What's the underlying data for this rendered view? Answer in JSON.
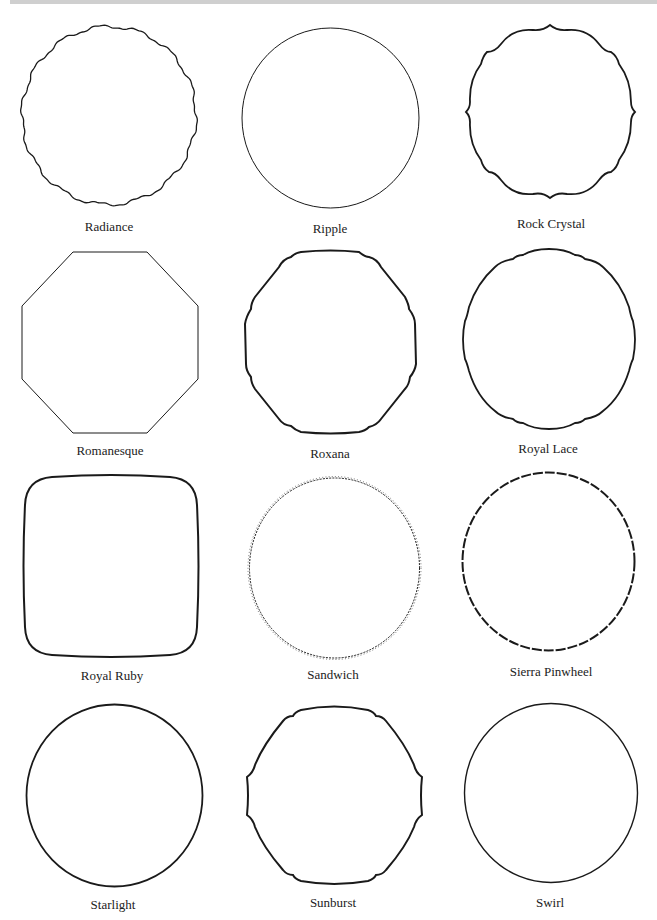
{
  "page": {
    "shapes": [
      {
        "name": "Radiance"
      },
      {
        "name": "Ripple"
      },
      {
        "name": "Rock Crystal"
      },
      {
        "name": "Romanesque"
      },
      {
        "name": "Roxana"
      },
      {
        "name": "Royal Lace"
      },
      {
        "name": "Royal Ruby"
      },
      {
        "name": "Sandwich"
      },
      {
        "name": "Sierra Pinwheel"
      },
      {
        "name": "Starlight"
      },
      {
        "name": "Sunburst"
      },
      {
        "name": "Swirl"
      }
    ]
  },
  "colors": {
    "outline": "#1a1a1a",
    "top_bar": "#cfcfcf",
    "background": "#ffffff"
  }
}
